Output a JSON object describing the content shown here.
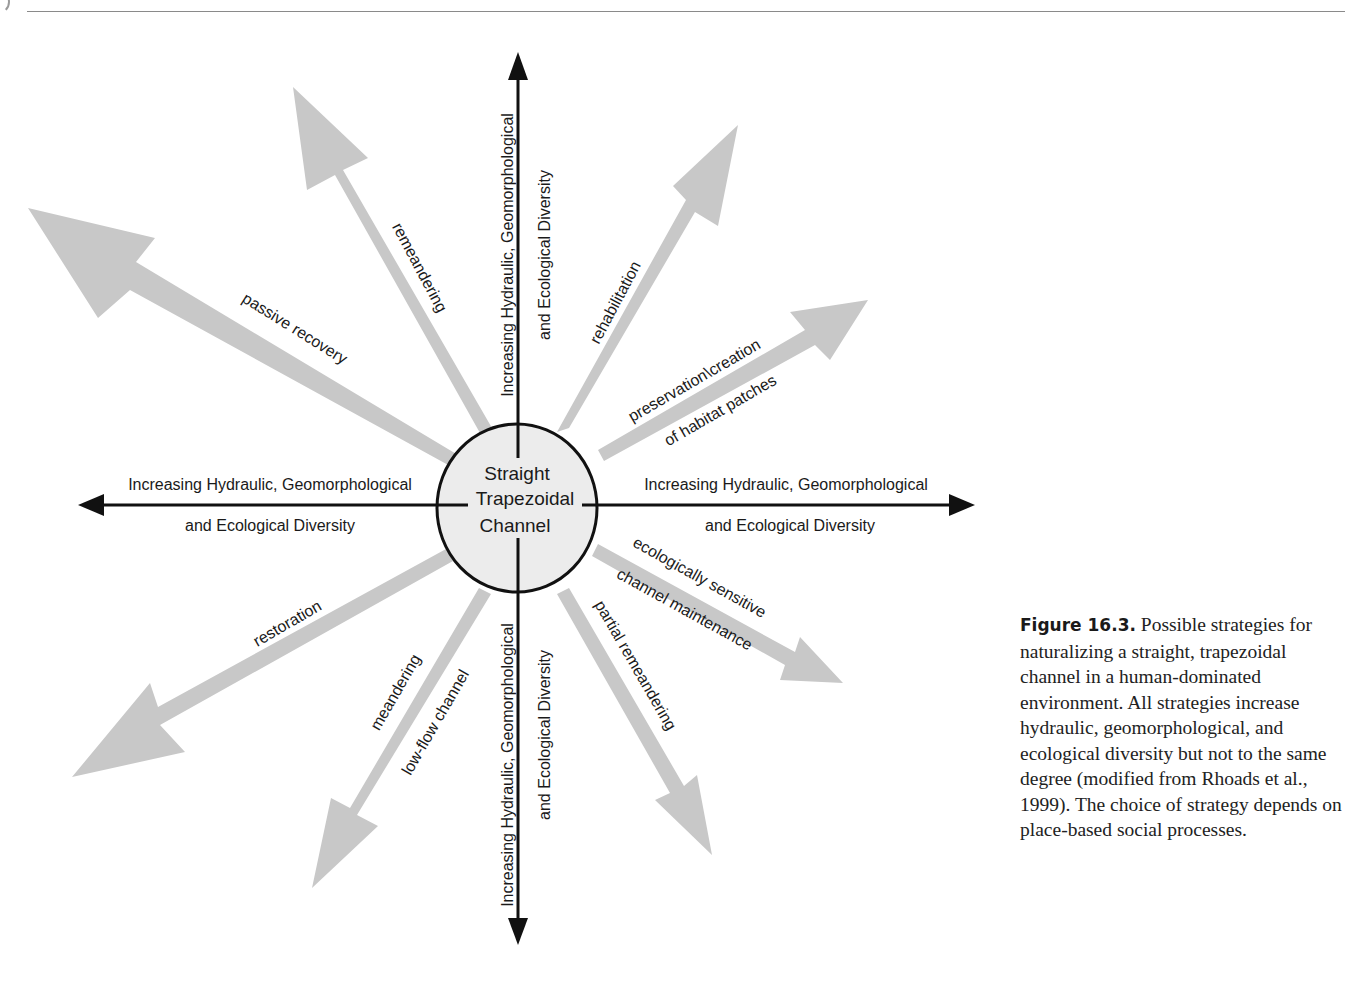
{
  "page": {
    "header_rule": true
  },
  "diagram": {
    "center": {
      "line1": "Straight",
      "line2": "Trapezoidal",
      "line3": "Channel"
    },
    "axes": {
      "top": {
        "line1": "Increasing Hydraulic, Geomorphological",
        "line2": "and Ecological Diversity"
      },
      "bottom": {
        "line1": "Increasing Hydraulic, Geomorphological",
        "line2": "and Ecological Diversity"
      },
      "left": {
        "line1": "Increasing Hydraulic, Geomorphological",
        "line2": "and Ecological Diversity"
      },
      "right": {
        "line1": "Increasing Hydraulic, Geomorphological",
        "line2": "and Ecological Diversity"
      }
    },
    "strategies": [
      {
        "id": "passive-recovery",
        "label": "passive recovery"
      },
      {
        "id": "remeandering",
        "label": "remeandering"
      },
      {
        "id": "rehabilitation",
        "label": "rehabilitation"
      },
      {
        "id": "preservation",
        "label1": "preservation\\creation",
        "label2": "of habitat patches"
      },
      {
        "id": "ecologically-sensitive",
        "label1": "ecologically sensitive",
        "label2": "channel maintenance"
      },
      {
        "id": "partial-remeandering",
        "label": "partial remeandering"
      },
      {
        "id": "meandering-low-flow",
        "label1": "meandering",
        "label2": "low-flow channel"
      },
      {
        "id": "restoration",
        "label": "restoration"
      }
    ],
    "colors": {
      "strategy_arrow": "#c8c8c8",
      "axis": "#111111",
      "circle_fill": "#ececec"
    }
  },
  "caption": {
    "figure_label": "Figure 16.3.",
    "text": " Possible strategies for naturalizing a straight, trapezoidal channel in a human-dominated environment. All strategies increase hydraulic, geomorphological, and ecological diversity but not to the same degree (modified from Rhoads et al., 1999). The choice of strategy depends on place-based social processes."
  }
}
